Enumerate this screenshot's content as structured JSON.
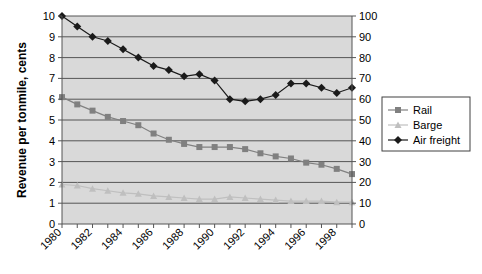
{
  "chart_data": {
    "type": "line",
    "title": "",
    "xlabel": "",
    "ylabel": "Revenue per tonmile, cents",
    "ylim": [
      0,
      10
    ],
    "y2lim": [
      0,
      100
    ],
    "grid": true,
    "legend_position": "right",
    "x": [
      1980,
      1981,
      1982,
      1983,
      1984,
      1985,
      1986,
      1987,
      1988,
      1989,
      1990,
      1991,
      1992,
      1993,
      1994,
      1995,
      1996,
      1997,
      1998,
      1999
    ],
    "x_tick_labels": [
      "1980",
      "1982",
      "1984",
      "1986",
      "1988",
      "1990",
      "1992",
      "1994",
      "1996",
      "1998"
    ],
    "y_tick_labels": [
      "0",
      "1",
      "2",
      "3",
      "4",
      "5",
      "6",
      "7",
      "8",
      "9",
      "10"
    ],
    "y2_tick_labels": [
      "0",
      "10",
      "20",
      "30",
      "40",
      "50",
      "60",
      "70",
      "80",
      "90",
      "100"
    ],
    "series": [
      {
        "name": "Rail",
        "axis": "left",
        "marker": "square",
        "color": "#808080",
        "values": [
          6.1,
          5.75,
          5.45,
          5.15,
          4.95,
          4.75,
          4.35,
          4.05,
          3.85,
          3.7,
          3.7,
          3.7,
          3.6,
          3.4,
          3.25,
          3.15,
          2.95,
          2.85,
          2.65,
          2.4
        ]
      },
      {
        "name": "Barge",
        "axis": "left",
        "marker": "triangle",
        "color": "#bfbfbf",
        "values": [
          1.9,
          1.85,
          1.7,
          1.6,
          1.5,
          1.45,
          1.35,
          1.3,
          1.25,
          1.2,
          1.2,
          1.3,
          1.25,
          1.2,
          1.15,
          1.1,
          1.1,
          1.1,
          1.05,
          1.05
        ]
      },
      {
        "name": "Air freight",
        "axis": "right",
        "marker": "diamond",
        "color": "#1a1a1a",
        "values": [
          100,
          95,
          90,
          88,
          84,
          80,
          76,
          74,
          71,
          72,
          69,
          60,
          59,
          60,
          62,
          67.5,
          67.5,
          65.5,
          63,
          65.5
        ]
      }
    ]
  },
  "legend": {
    "items": [
      {
        "label": "Rail"
      },
      {
        "label": "Barge"
      },
      {
        "label": "Air freight"
      }
    ]
  },
  "colors": {
    "plot_background": "#d9d9d9",
    "gridline": "#555555",
    "rail": "#808080",
    "barge": "#bfbfbf",
    "air_freight": "#1a1a1a"
  }
}
